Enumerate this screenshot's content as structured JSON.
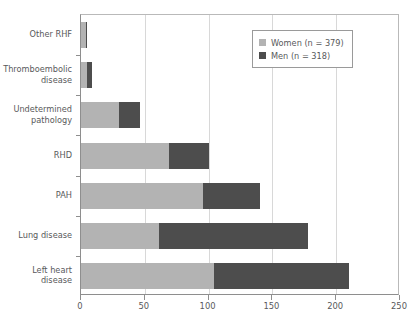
{
  "chart_data": {
    "type": "bar",
    "orientation": "horizontal",
    "stacked": true,
    "title": "",
    "xlabel": "",
    "ylabel": "",
    "xlim": [
      0,
      250
    ],
    "xticks": [
      0,
      50,
      100,
      150,
      200,
      250
    ],
    "xtick_labels": [
      "0",
      "50",
      "100",
      "150",
      "200",
      "250"
    ],
    "grid": true,
    "grid_axis": "x",
    "legend_position": "top-right",
    "categories": [
      "Other RHF",
      "Thromboembolic\ndisease",
      "Undetermined\npathology",
      "RHD",
      "PAH",
      "Lung disease",
      "Left heart\ndisease"
    ],
    "series": [
      {
        "name": "Women (n = 379)",
        "color": "#b3b3b3",
        "values": [
          4,
          5,
          30,
          69,
          96,
          61,
          104
        ]
      },
      {
        "name": "Men (n = 318)",
        "color": "#4d4d4d",
        "values": [
          1,
          4,
          16,
          31,
          44,
          117,
          106
        ]
      }
    ],
    "totals": [
      5,
      9,
      46,
      100,
      140,
      178,
      210
    ]
  },
  "legend": {
    "items": [
      {
        "label": "Women (n = 379)",
        "color": "#b3b3b3"
      },
      {
        "label": "Men (n = 318)",
        "color": "#4d4d4d"
      }
    ]
  },
  "colors": {
    "women": "#b3b3b3",
    "men": "#4d4d4d",
    "axis": "#8e8e8e",
    "grid": "#d8d8d8",
    "text": "#58595b",
    "background": "#ffffff"
  }
}
